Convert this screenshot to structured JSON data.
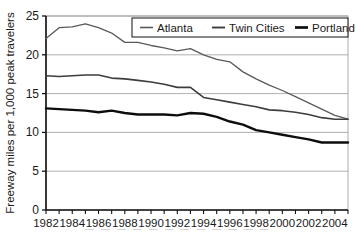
{
  "chart_data": {
    "type": "line",
    "title": "",
    "xlabel": "",
    "ylabel": "Freeway miles per 1,000 peak travelers",
    "xlim": [
      1982,
      2005
    ],
    "ylim": [
      0,
      25
    ],
    "yticks": [
      0,
      5,
      10,
      15,
      20,
      25
    ],
    "ytick_labels": [
      "0",
      "5",
      "10",
      "15",
      "20",
      "25"
    ],
    "xticks": [
      1982,
      1983,
      1984,
      1985,
      1986,
      1987,
      1988,
      1989,
      1990,
      1991,
      1992,
      1993,
      1994,
      1995,
      1996,
      1997,
      1998,
      1999,
      2000,
      2001,
      2002,
      2003,
      2004,
      2005
    ],
    "xtick_labels_shown": [
      "1982",
      "1984",
      "1986",
      "1988",
      "1990",
      "1992",
      "1994",
      "1996",
      "1998",
      "2000",
      "2002",
      "2004"
    ],
    "grid": "horizontal",
    "legend_position": "top-right",
    "x": [
      1982,
      1983,
      1984,
      1985,
      1986,
      1987,
      1988,
      1989,
      1990,
      1991,
      1992,
      1993,
      1994,
      1995,
      1996,
      1997,
      1998,
      1999,
      2000,
      2001,
      2002,
      2003,
      2004,
      2005
    ],
    "series": [
      {
        "name": "Atlanta",
        "color": "#595959",
        "width": 1.3,
        "values": [
          22.1,
          23.5,
          23.6,
          24.0,
          23.5,
          22.8,
          21.6,
          21.6,
          21.2,
          20.9,
          20.5,
          20.8,
          20.0,
          19.4,
          19.1,
          17.8,
          16.9,
          16.1,
          15.4,
          14.6,
          13.8,
          13.0,
          12.2,
          11.7
        ]
      },
      {
        "name": "Twin Cities",
        "color": "#3d3d3d",
        "width": 1.6,
        "values": [
          17.3,
          17.2,
          17.3,
          17.4,
          17.4,
          17.0,
          16.9,
          16.7,
          16.5,
          16.2,
          15.8,
          15.8,
          14.5,
          14.2,
          13.9,
          13.6,
          13.3,
          12.9,
          12.8,
          12.6,
          12.3,
          11.9,
          11.7,
          11.7
        ]
      },
      {
        "name": "Portland",
        "color": "#0d0d0d",
        "width": 2.4,
        "values": [
          13.1,
          13.0,
          12.9,
          12.8,
          12.6,
          12.8,
          12.5,
          12.3,
          12.3,
          12.3,
          12.2,
          12.5,
          12.4,
          12.0,
          11.4,
          11.0,
          10.3,
          10.0,
          9.7,
          9.4,
          9.1,
          8.7,
          8.7,
          8.7
        ]
      }
    ]
  },
  "legend": {
    "items": [
      {
        "label": "Atlanta"
      },
      {
        "label": "Twin Cities"
      },
      {
        "label": "Portland"
      }
    ]
  },
  "axes": {
    "y_axis_title": "Freeway miles per 1,000 peak travelers"
  },
  "page": {
    "caption_fragment": "— — — — — — — — — — — —"
  }
}
